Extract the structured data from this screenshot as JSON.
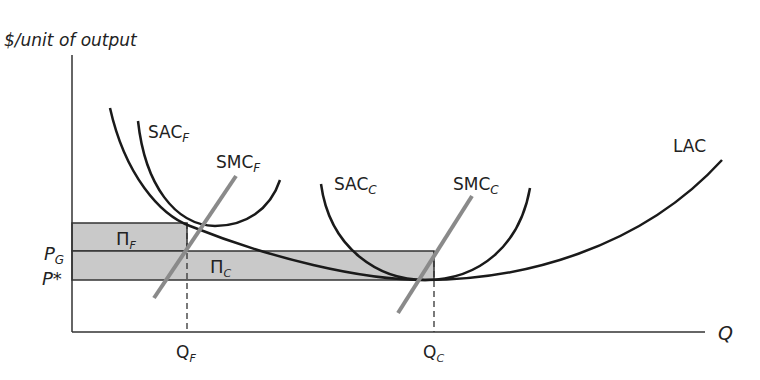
{
  "diagram": {
    "y_axis_label": "$/unit of output",
    "x_axis_label": "Q",
    "curves": {
      "lac": {
        "label": "LAC"
      },
      "sac_f": {
        "label": "SAC",
        "sub": "F"
      },
      "smc_f": {
        "label": "SMC",
        "sub": "F"
      },
      "sac_c": {
        "label": "SAC",
        "sub": "C"
      },
      "smc_c": {
        "label": "SMC",
        "sub": "C"
      }
    },
    "price_levels": {
      "p_g": {
        "label": "P",
        "sub": "G"
      },
      "p_star": {
        "label": "P*"
      }
    },
    "quantities": {
      "q_f": {
        "label": "Q",
        "sub": "F"
      },
      "q_c": {
        "label": "Q",
        "sub": "C"
      }
    },
    "profit_areas": {
      "pi_f": {
        "label": "Π",
        "sub": "F"
      },
      "pi_c": {
        "label": "Π",
        "sub": "C"
      }
    },
    "colors": {
      "curve": "#1a1a1a",
      "smc": "#8a8a8a",
      "shade": "#c8c8c8",
      "axis": "#333333"
    }
  }
}
